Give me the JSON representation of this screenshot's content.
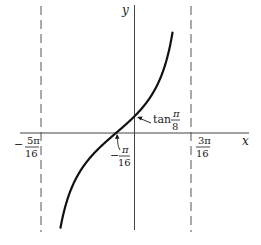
{
  "figure": {
    "function": "y = tan(2x + π/8)",
    "axes": {
      "x_label": "x",
      "y_label": "y"
    },
    "asymptotes": [
      {
        "position": "-5π/16",
        "num": "5π",
        "den": "16",
        "sign": "−"
      },
      {
        "position": "3π/16",
        "num": "3π",
        "den": "16",
        "sign": ""
      }
    ],
    "annotations": {
      "x_intercept": {
        "sign": "−",
        "num": "π",
        "den": "16"
      },
      "y_intercept": {
        "prefix": "tan",
        "num": "π",
        "den": "8"
      }
    },
    "colors": {
      "curve": "#111111",
      "axes": "#444444",
      "asymptote": "#555555",
      "background": "#ffffff"
    }
  }
}
